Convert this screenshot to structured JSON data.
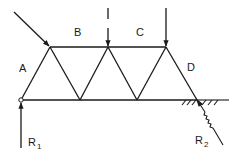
{
  "diagram": {
    "type": "warren-truss",
    "colors": {
      "stroke": "#1a1a1a",
      "background": "#ffffff"
    },
    "nodes": {
      "bottom": [
        [
          21,
          100
        ],
        [
          80,
          100
        ],
        [
          137,
          100
        ],
        [
          197,
          100
        ]
      ],
      "top": [
        [
          50,
          47
        ],
        [
          108,
          47
        ],
        [
          166,
          47
        ]
      ]
    },
    "zone_labels": {
      "A": "A",
      "B": "B",
      "C": "C",
      "D": "D"
    },
    "loads": [
      {
        "name": "inclined-load",
        "from": [
          14,
          12
        ],
        "to": [
          50,
          47
        ]
      },
      {
        "name": "vertical-load-center",
        "from": [
          108,
          8
        ],
        "to": [
          108,
          46
        ],
        "dashed_break": true
      },
      {
        "name": "vertical-load-right",
        "from": [
          166,
          8
        ],
        "to": [
          166,
          46
        ]
      }
    ],
    "reactions": {
      "R1": {
        "label": "R",
        "subscript": "1"
      },
      "R2": {
        "label": "R",
        "subscript": "2"
      }
    }
  }
}
